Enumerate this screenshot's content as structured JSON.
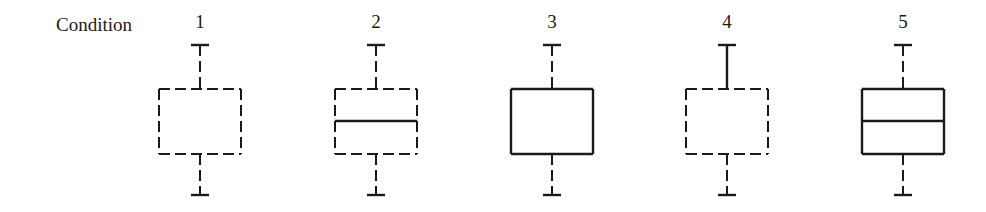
{
  "row_label": "Condition",
  "conditions": [
    {
      "label": "1",
      "cx": 200,
      "box": "dashed",
      "median": false,
      "upper_whisker": "dashed",
      "lower_whisker": "dashed"
    },
    {
      "label": "2",
      "cx": 376,
      "box": "dashed",
      "median": true,
      "upper_whisker": "dashed",
      "lower_whisker": "dashed"
    },
    {
      "label": "3",
      "cx": 552,
      "box": "solid",
      "median": false,
      "upper_whisker": "dashed",
      "lower_whisker": "dashed"
    },
    {
      "label": "4",
      "cx": 727,
      "box": "dashed",
      "median": false,
      "upper_whisker": "solid",
      "lower_whisker": "dashed"
    },
    {
      "label": "5",
      "cx": 903,
      "box": "solid",
      "median": true,
      "upper_whisker": "dashed",
      "lower_whisker": "dashed"
    }
  ],
  "geometry": {
    "box_half_width": 41,
    "box_top": 89,
    "box_bottom": 154,
    "median_y": 121,
    "cap_top": 45,
    "cap_bottom": 195,
    "cap_half_width": 9
  },
  "colors": {
    "stroke": "#1a1a1a"
  }
}
